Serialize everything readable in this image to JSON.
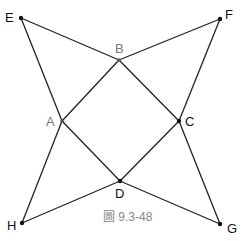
{
  "diagram": {
    "caption": "圖 9.3-48",
    "colors": {
      "line": "#222222",
      "label_dark": "#111111",
      "label_gray": "#777777",
      "caption": "#888888"
    },
    "points": {
      "E": {
        "label": "E",
        "x": 21,
        "y": 18
      },
      "F": {
        "label": "F",
        "x": 220,
        "y": 19
      },
      "B": {
        "label": "B",
        "x": 119,
        "y": 60
      },
      "A": {
        "label": "A",
        "x": 62,
        "y": 121
      },
      "C": {
        "label": "C",
        "x": 179,
        "y": 121
      },
      "D": {
        "label": "D",
        "x": 120,
        "y": 181
      },
      "H": {
        "label": "H",
        "x": 22,
        "y": 223
      },
      "G": {
        "label": "G",
        "x": 220,
        "y": 224
      }
    },
    "segments": [
      [
        "E",
        "B"
      ],
      [
        "B",
        "F"
      ],
      [
        "E",
        "A"
      ],
      [
        "F",
        "C"
      ],
      [
        "A",
        "B"
      ],
      [
        "B",
        "C"
      ],
      [
        "A",
        "D"
      ],
      [
        "D",
        "C"
      ],
      [
        "A",
        "H"
      ],
      [
        "H",
        "D"
      ],
      [
        "D",
        "G"
      ],
      [
        "C",
        "G"
      ]
    ]
  }
}
